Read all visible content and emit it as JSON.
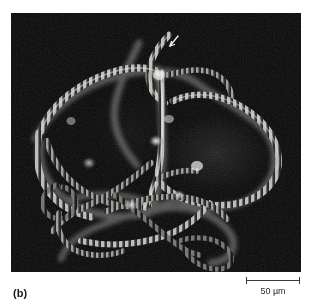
{
  "figure": {
    "panel_label": "(b)",
    "background_color": "#ffffff",
    "micrograph": {
      "background_color": "#050506",
      "modality": "fluorescence-micrograph",
      "subject": "polytene chromosomes",
      "annotation_arrow": "arrow-marker",
      "panel_rect": {
        "x": 11,
        "y": 13,
        "width": 290,
        "height": 259
      }
    },
    "scale_bar": {
      "label": "50 µm",
      "length_px": 54,
      "color": "#3a3a3a"
    },
    "colors": {
      "panel_background": "#050506",
      "chromatin_bright": "#e8e8e6",
      "chromatin_mid": "#8f8f8c",
      "chromatin_dim": "#4a4a49",
      "nucleolus_haze": "#242424",
      "text": "#1a1a1a",
      "rule": "#3a3a3a"
    }
  }
}
